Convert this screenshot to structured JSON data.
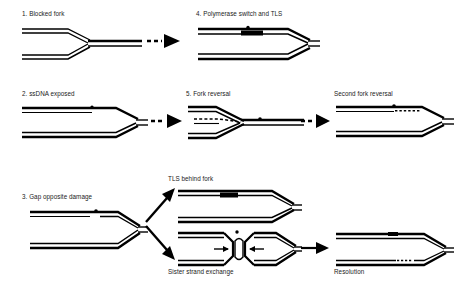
{
  "figure": {
    "type": "diagram",
    "background": "#ffffff",
    "ink": "#000000"
  },
  "panels": [
    {
      "id": "p1",
      "label": "1. Blocked fork",
      "x": 22,
      "y": 10
    },
    {
      "id": "p4",
      "label": "4. Polymerase switch and TLS",
      "x": 196,
      "y": 10
    },
    {
      "id": "p2",
      "label": "2. ssDNA exposed",
      "x": 22,
      "y": 90
    },
    {
      "id": "p5",
      "label": "5. Fork reversal",
      "x": 186,
      "y": 90
    },
    {
      "id": "p6",
      "label": "Second fork reversal",
      "x": 334,
      "y": 90
    },
    {
      "id": "p3",
      "label": "3. Gap opposite damage",
      "x": 22,
      "y": 193
    },
    {
      "id": "p7",
      "label": "TLS behind fork",
      "x": 168,
      "y": 175
    },
    {
      "id": "p8",
      "label": "Sister strand exchange",
      "x": 168,
      "y": 268
    },
    {
      "id": "p9",
      "label": "Resolution",
      "x": 334,
      "y": 268
    }
  ],
  "arrows": [
    {
      "id": "a1",
      "style": "dashed-tail",
      "from": "1. Blocked fork",
      "to": "4. Polymerase switch and TLS"
    },
    {
      "id": "a2",
      "style": "dashed-tail",
      "from": "2. ssDNA exposed",
      "to": "5. Fork reversal"
    },
    {
      "id": "a3",
      "style": "dashed-tail",
      "from": "5. Fork reversal",
      "to": "Second fork reversal"
    },
    {
      "id": "a4",
      "style": "solid-up",
      "from": "3. Gap opposite damage",
      "to": "TLS behind fork"
    },
    {
      "id": "a5",
      "style": "solid-down",
      "from": "3. Gap opposite damage",
      "to": "Sister strand exchange"
    },
    {
      "id": "a6",
      "style": "solid",
      "from": "Sister strand exchange",
      "to": "Resolution"
    }
  ],
  "markers": {
    "lesion": "lesion-dot",
    "tls_patch": "black-rectangle",
    "regressed_arm": "dashed-strand",
    "repair_patch": "hatched-segment",
    "branch_migration": "inward-arrows"
  }
}
